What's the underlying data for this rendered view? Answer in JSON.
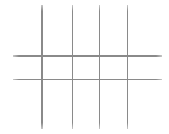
{
  "canvas": {
    "width": 169,
    "height": 134,
    "background_color": "#ffffff"
  },
  "grid": {
    "line_color": "#8a8a8a",
    "line_fade_color": "#c8c8c8",
    "line_thickness": 1.5,
    "vertical_lines": [
      {
        "x": 42,
        "y1": 5,
        "y2": 129
      },
      {
        "x": 72.5,
        "y1": 5,
        "y2": 129
      },
      {
        "x": 99.5,
        "y1": 5,
        "y2": 129
      },
      {
        "x": 127.5,
        "y1": 5,
        "y2": 129
      }
    ],
    "horizontal_lines": [
      {
        "y": 56,
        "x1": 13,
        "x2": 162
      },
      {
        "y": 79.5,
        "x1": 13,
        "x2": 162
      }
    ]
  }
}
